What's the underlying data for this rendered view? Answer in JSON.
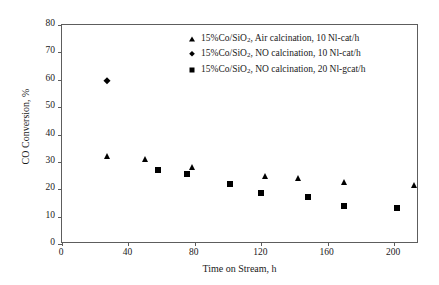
{
  "chart_data": {
    "type": "scatter",
    "title": "",
    "xlabel": "Time on Stream, h",
    "ylabel": "CO Conversion, %",
    "xlim": [
      0,
      215
    ],
    "ylim": [
      0,
      80
    ],
    "xticks": [
      0,
      40,
      80,
      120,
      160,
      200
    ],
    "yticks": [
      0,
      10,
      20,
      30,
      40,
      50,
      60,
      70,
      80
    ],
    "grid": false,
    "legend_position": "top-right-inside",
    "series": [
      {
        "name": "15%Co/SiO2, Air calcination, 10 Nl-cat/h",
        "label_prefix": "15%Co/SiO",
        "label_sub": "2",
        "label_suffix": ", Air calcination, 10 Nl-cat/h",
        "marker": "triangle",
        "color": "#000000",
        "points": [
          {
            "x": 27,
            "y": 32.0
          },
          {
            "x": 50,
            "y": 31.0
          },
          {
            "x": 78,
            "y": 28.0
          },
          {
            "x": 122,
            "y": 25.0
          },
          {
            "x": 142,
            "y": 24.0
          },
          {
            "x": 170,
            "y": 22.5
          },
          {
            "x": 212,
            "y": 21.5
          }
        ]
      },
      {
        "name": "15%Co/SiO2, NO calcination, 10 Nl-cat/h",
        "label_prefix": "15%Co/SiO",
        "label_sub": "2",
        "label_suffix": ", NO calcination, 10 Nl-cat/h",
        "marker": "diamond",
        "color": "#000000",
        "points": [
          {
            "x": 27,
            "y": 59.5
          }
        ]
      },
      {
        "name": "15%Co/SiO2, NO calcination, 20 Nl-gcat/h",
        "label_prefix": "15%Co/SiO",
        "label_sub": "2",
        "label_suffix": ", NO calcination, 20 Nl-gcat/h",
        "marker": "square",
        "color": "#000000",
        "points": [
          {
            "x": 58,
            "y": 27.0
          },
          {
            "x": 75,
            "y": 25.5
          },
          {
            "x": 101,
            "y": 22.0
          },
          {
            "x": 120,
            "y": 18.5
          },
          {
            "x": 148,
            "y": 17.0
          },
          {
            "x": 170,
            "y": 14.0
          },
          {
            "x": 202,
            "y": 13.0
          }
        ]
      }
    ]
  }
}
